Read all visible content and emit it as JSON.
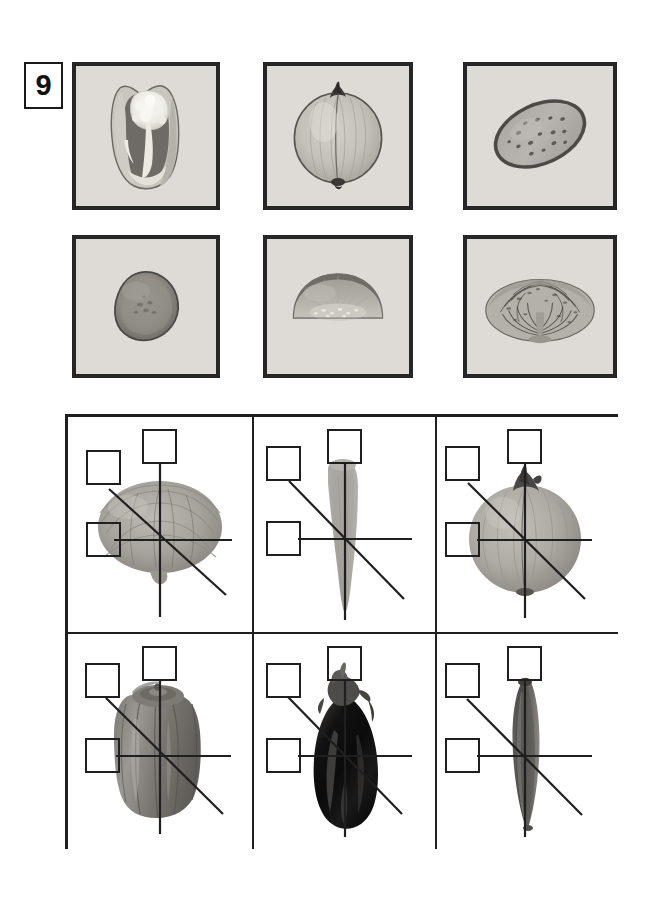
{
  "worksheet": {
    "exercise_number": "9",
    "ink_color": "#1f1f1f",
    "photo_bg_color": "#dedbd6",
    "photo_border_color": "#262626"
  },
  "cross_sections": {
    "caption": "",
    "rows": [
      [
        {
          "id": "bell-pepper-cross-section",
          "name": "bell pepper cross-section",
          "x": 72,
          "y": 62,
          "w": 148,
          "h": 148
        },
        {
          "id": "onion-cross-section",
          "name": "onion cross-section",
          "x": 263,
          "y": 62,
          "w": 150,
          "h": 148
        },
        {
          "id": "cucumber-slice-cross-section",
          "name": "cucumber slice cross-section",
          "x": 463,
          "y": 62,
          "w": 154,
          "h": 148
        }
      ],
      [
        {
          "id": "potato-cross-section",
          "name": "potato cross-section",
          "x": 72,
          "y": 235,
          "w": 148,
          "h": 143
        },
        {
          "id": "eggplant-half-cross-section",
          "name": "eggplant half cross-section",
          "x": 263,
          "y": 235,
          "w": 150,
          "h": 143
        },
        {
          "id": "cabbage-cross-section",
          "name": "cabbage cross-section",
          "x": 463,
          "y": 235,
          "w": 154,
          "h": 143
        }
      ]
    ]
  },
  "symmetry_grid": {
    "x": 65,
    "y": 414,
    "w": 553,
    "h": 435,
    "col_dividers": [
      186,
      369
    ],
    "row_divider": 217,
    "cells": [
      {
        "id": "cell-cabbage",
        "vegetable": "cabbage",
        "checkboxes": [
          {
            "id": "checkbox-vertical-axis",
            "label": "",
            "checked": false
          },
          {
            "id": "checkbox-diagonal-axis",
            "label": "",
            "checked": false
          },
          {
            "id": "checkbox-horizontal-axis",
            "label": "",
            "checked": false
          }
        ],
        "axes": [
          "vertical",
          "horizontal",
          "diagonal"
        ]
      },
      {
        "id": "cell-carrot",
        "vegetable": "carrot",
        "checkboxes": [
          {
            "id": "checkbox-vertical-axis",
            "label": "",
            "checked": false
          },
          {
            "id": "checkbox-diagonal-axis",
            "label": "",
            "checked": false
          },
          {
            "id": "checkbox-horizontal-axis",
            "label": "",
            "checked": false
          }
        ],
        "axes": [
          "vertical",
          "horizontal",
          "diagonal"
        ]
      },
      {
        "id": "cell-onion",
        "vegetable": "onion",
        "checkboxes": [
          {
            "id": "checkbox-vertical-axis",
            "label": "",
            "checked": false
          },
          {
            "id": "checkbox-diagonal-axis",
            "label": "",
            "checked": false
          },
          {
            "id": "checkbox-horizontal-axis",
            "label": "",
            "checked": false
          }
        ],
        "axes": [
          "vertical",
          "horizontal",
          "diagonal"
        ]
      },
      {
        "id": "cell-bell-pepper",
        "vegetable": "bell pepper",
        "checkboxes": [
          {
            "id": "checkbox-vertical-axis",
            "label": "",
            "checked": false
          },
          {
            "id": "checkbox-diagonal-axis",
            "label": "",
            "checked": false
          },
          {
            "id": "checkbox-horizontal-axis",
            "label": "",
            "checked": false
          }
        ],
        "axes": [
          "vertical",
          "horizontal",
          "diagonal"
        ]
      },
      {
        "id": "cell-eggplant",
        "vegetable": "eggplant",
        "checkboxes": [
          {
            "id": "checkbox-vertical-axis",
            "label": "",
            "checked": false
          },
          {
            "id": "checkbox-diagonal-axis",
            "label": "",
            "checked": false
          },
          {
            "id": "checkbox-horizontal-axis",
            "label": "",
            "checked": false
          }
        ],
        "axes": [
          "vertical",
          "horizontal",
          "diagonal"
        ]
      },
      {
        "id": "cell-cucumber",
        "vegetable": "cucumber",
        "checkboxes": [
          {
            "id": "checkbox-vertical-axis",
            "label": "",
            "checked": false
          },
          {
            "id": "checkbox-diagonal-axis",
            "label": "",
            "checked": false
          },
          {
            "id": "checkbox-horizontal-axis",
            "label": "",
            "checked": false
          }
        ],
        "axes": [
          "vertical",
          "horizontal",
          "diagonal"
        ]
      }
    ]
  }
}
